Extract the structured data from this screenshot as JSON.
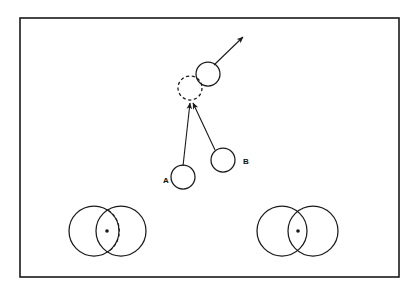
{
  "figure": {
    "background_color": "#ffffff",
    "stroke_color": "#1a1a1a",
    "frame": {
      "name": "outer-frame",
      "x": 20,
      "y": 18,
      "width": 379,
      "height": 259,
      "stroke_width": 1.6
    },
    "labels": [
      {
        "id": "label-a",
        "text": "A",
        "x": 163,
        "y": 183
      },
      {
        "id": "label-b",
        "text": "B",
        "x": 243,
        "y": 164
      }
    ],
    "circles": [
      {
        "id": "moving-disk",
        "role": "post-collision-disk-solid",
        "cx": 208,
        "cy": 74,
        "r": 12,
        "style": "solid"
      },
      {
        "id": "ghost-disk",
        "role": "collision-point-disk-dashed",
        "cx": 190,
        "cy": 88,
        "r": 12,
        "style": "dashed"
      },
      {
        "id": "disk-a",
        "role": "disk-a",
        "cx": 183,
        "cy": 177,
        "r": 12,
        "style": "solid"
      },
      {
        "id": "disk-b",
        "role": "disk-b",
        "cx": 223,
        "cy": 160,
        "r": 12,
        "style": "solid"
      }
    ],
    "arrows": [
      {
        "id": "arrow-outgoing",
        "role": "outgoing-velocity-vector",
        "x1": 214,
        "y1": 65,
        "x2": 243,
        "y2": 37
      },
      {
        "id": "arrow-from-a",
        "role": "velocity-vector-from-a",
        "x1": 183,
        "y1": 166,
        "x2": 190,
        "y2": 101
      },
      {
        "id": "arrow-from-b",
        "role": "velocity-vector-from-b",
        "x1": 216,
        "y1": 150,
        "x2": 192,
        "y2": 101
      }
    ],
    "circle_pairs": [
      {
        "id": "pair-left",
        "role": "overlapping-disk-pair-left",
        "left": {
          "cx": 94,
          "cy": 231,
          "r": 25
        },
        "right": {
          "cx": 121,
          "cy": 231,
          "r": 25
        },
        "center_dot": {
          "cx": 106,
          "cy": 231,
          "r": 1.8
        },
        "has_dashed_arc": true
      },
      {
        "id": "pair-right",
        "role": "overlapping-disk-pair-right",
        "left": {
          "cx": 282,
          "cy": 231,
          "r": 25
        },
        "right": {
          "cx": 313,
          "cy": 231,
          "r": 25
        },
        "center_dot": {
          "cx": 298,
          "cy": 231,
          "r": 1.8
        },
        "has_dashed_arc": false
      }
    ]
  }
}
